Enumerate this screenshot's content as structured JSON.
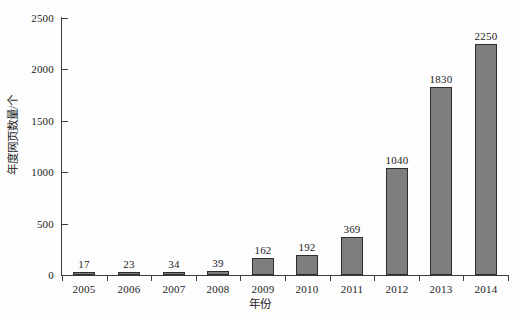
{
  "chart_data": {
    "type": "bar",
    "title": "",
    "subtitle": "",
    "categories": [
      "2005",
      "2006",
      "2007",
      "2008",
      "2009",
      "2010",
      "2011",
      "2012",
      "2013",
      "2014"
    ],
    "values": [
      17,
      23,
      34,
      39,
      162,
      192,
      369,
      1040,
      1830,
      2250
    ],
    "data_labels": [
      "17",
      "23",
      "34",
      "39",
      "162",
      "192",
      "369",
      "1040",
      "1830",
      "2250"
    ],
    "xlabel": "年份",
    "ylabel": "年度网页数量/个",
    "ylim": [
      0,
      2500
    ],
    "yticks": [
      0,
      500,
      1000,
      1500,
      2000,
      2500
    ],
    "ytick_labels": [
      "0",
      "500",
      "1000",
      "1500",
      "2000",
      "2500"
    ],
    "grid": false,
    "legend": false,
    "legend_position": "none",
    "bar_color": "#7e7e7e",
    "bar_edge_color": "#2e2e2e",
    "axis_color": "#3d3d3d",
    "background_color": "#fdfdfd",
    "text_color": "#1c1c1c"
  }
}
